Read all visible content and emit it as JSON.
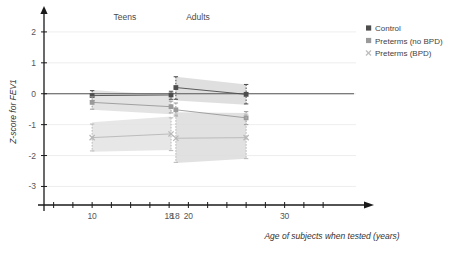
{
  "chart_data": {
    "type": "line",
    "title": "",
    "xlabel": "Age of subjects when tested (years)",
    "ylabel": "Z-score for FEV1",
    "xlim": [
      5,
      37
    ],
    "ylim": [
      -3.6,
      2.45
    ],
    "grid": true,
    "legend_position": "right",
    "x_ticks": [
      6,
      8,
      10,
      12,
      14,
      16,
      18,
      20,
      22,
      24,
      26,
      28,
      30,
      32,
      34
    ],
    "x_tick_labels": [
      "10",
      "18",
      "18",
      "20",
      "30"
    ],
    "x_tick_label_values": [
      10,
      18,
      18.6,
      20,
      30
    ],
    "y_ticks": [
      2,
      1,
      0,
      -1,
      -2,
      -3
    ],
    "y_tick_labels": [
      "2",
      "1",
      "0",
      "-1",
      "-2",
      "-3"
    ],
    "group_labels": [
      {
        "text": "Teens",
        "x": 13.4,
        "y": 2.38
      },
      {
        "text": "Adults",
        "x": 21.0,
        "y": 2.38
      }
    ],
    "series": [
      {
        "name": "Control",
        "color": "#4d4d4d",
        "marker": "filled-square",
        "panels": [
          {
            "panel": "Teens",
            "x_start": 10.0,
            "x_end": 18.2,
            "y_start": -0.06,
            "y_end": -0.04,
            "ci_start": [
              0.1,
              -0.22
            ],
            "ci_end": [
              0.08,
              -0.18
            ]
          },
          {
            "panel": "Adults",
            "x_start": 18.7,
            "x_end": 26.0,
            "y_start": 0.2,
            "y_end": -0.02,
            "ci_start": [
              0.55,
              -0.18
            ],
            "ci_end": [
              0.3,
              -0.33
            ]
          }
        ]
      },
      {
        "name": "Preterms (no BPD)",
        "color": "#9a9a9a",
        "marker": "filled-square",
        "panels": [
          {
            "panel": "Teens",
            "x_start": 10.0,
            "x_end": 18.2,
            "y_start": -0.28,
            "y_end": -0.42,
            "ci_start": [
              -0.1,
              -0.5
            ],
            "ci_end": [
              -0.24,
              -0.62
            ]
          },
          {
            "panel": "Adults",
            "x_start": 18.7,
            "x_end": 26.0,
            "y_start": -0.52,
            "y_end": -0.78,
            "ci_start": [
              -0.3,
              -0.72
            ],
            "ci_end": [
              -0.58,
              -1.0
            ]
          }
        ]
      },
      {
        "name": "Preterms (BPD)",
        "color": "#b8b8b8",
        "marker": "cross",
        "panels": [
          {
            "panel": "Teens",
            "x_start": 10.0,
            "x_end": 18.2,
            "y_start": -1.42,
            "y_end": -1.3,
            "ci_start": [
              -0.98,
              -1.85
            ],
            "ci_end": [
              -0.78,
              -1.84
            ]
          },
          {
            "panel": "Adults",
            "x_start": 18.7,
            "x_end": 26.0,
            "y_start": -1.44,
            "y_end": -1.42,
            "ci_start": [
              -0.66,
              -2.22
            ],
            "ci_end": [
              -0.66,
              -2.1
            ]
          }
        ]
      }
    ],
    "bands": [
      {
        "series": "Preterms (no BPD)",
        "panel": "Teens",
        "x_start": 10.0,
        "x_end": 18.2,
        "upper_start": 0.12,
        "lower_start": -0.52,
        "upper_end": -0.05,
        "lower_end": -0.66,
        "fill": "#dedede"
      },
      {
        "series": "Preterms (BPD)",
        "panel": "Teens",
        "x_start": 10.0,
        "x_end": 18.2,
        "upper_start": -0.92,
        "lower_start": -1.88,
        "upper_end": -0.74,
        "lower_end": -1.82,
        "fill": "#e3e3e3"
      },
      {
        "series": "Control",
        "panel": "Adults",
        "x_start": 18.7,
        "x_end": 26.0,
        "upper_start": 0.55,
        "lower_start": -0.22,
        "upper_end": 0.3,
        "lower_end": -0.36,
        "fill": "#d9d9d9"
      },
      {
        "series": "Preterms (no BPD)",
        "panel": "Adults",
        "x_start": 18.7,
        "x_end": 26.0,
        "upper_start": -0.6,
        "lower_start": -2.24,
        "upper_end": -0.62,
        "lower_end": -2.1,
        "fill": "#dcdcdc"
      }
    ],
    "baseline_z": 0
  },
  "legend": {
    "items": [
      {
        "label": "Control",
        "color": "#4d4d4d"
      },
      {
        "label": "Preterms (no BPD)",
        "color": "#9a9a9a"
      },
      {
        "label": "Preterms (BPD)",
        "color": "#bdbdbd"
      }
    ]
  },
  "axes": {
    "y_title": "Z-score for FEV1",
    "x_title": "Age of subjects when tested (years)"
  }
}
